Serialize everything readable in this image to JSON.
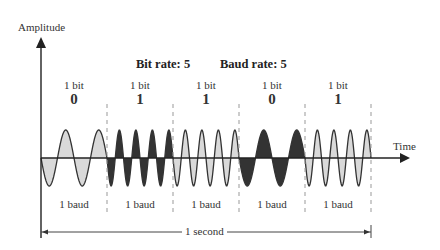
{
  "diagram": {
    "y_axis_label": "Amplitude",
    "x_axis_label": "Time",
    "bit_rate_label": "Bit rate: 5",
    "baud_rate_label": "Baud rate: 5",
    "duration_label": "1 second",
    "colors": {
      "light_fill": "#d9d9d9",
      "dark_fill": "#333333",
      "stroke": "#333333",
      "divider": "#999999"
    },
    "segments": [
      {
        "bit_label": "1 bit",
        "bit_value": "0",
        "baud_label": "1 baud",
        "cycles": 2,
        "fill": "light"
      },
      {
        "bit_label": "1 bit",
        "bit_value": "1",
        "baud_label": "1 baud",
        "cycles": 4,
        "fill": "dark"
      },
      {
        "bit_label": "1 bit",
        "bit_value": "1",
        "baud_label": "1 baud",
        "cycles": 4,
        "fill": "light"
      },
      {
        "bit_label": "1 bit",
        "bit_value": "0",
        "baud_label": "1 baud",
        "cycles": 2,
        "fill": "dark"
      },
      {
        "bit_label": "1 bit",
        "bit_value": "1",
        "baud_label": "1 baud",
        "cycles": 4,
        "fill": "light"
      }
    ]
  }
}
